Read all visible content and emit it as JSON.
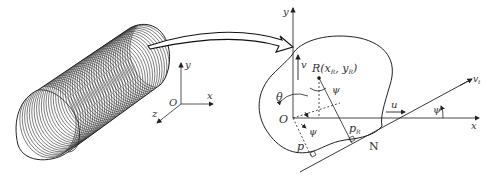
{
  "diagram": {
    "left_panel": {
      "object": "coiled-cylinder",
      "axes": {
        "origin": "O",
        "x": "x",
        "y": "y",
        "z": "z"
      }
    },
    "connector": "curved-arrow",
    "right_panel": {
      "axes": {
        "origin": "O",
        "x": "x",
        "y": "y"
      },
      "labels": {
        "reference_point": "R(x",
        "ref_sub1": "R",
        "ref_mid": ", y",
        "ref_sub2": "R",
        "ref_close": ")",
        "theta": "θ",
        "psi_top": "ψ",
        "psi_bottom": "ψ",
        "psi_right": "ψ",
        "u": "u",
        "v": "v",
        "p": "p",
        "pR": "p",
        "pR_sub": "R",
        "N": "N",
        "line_label": "v",
        "line_sub": "t"
      }
    }
  }
}
